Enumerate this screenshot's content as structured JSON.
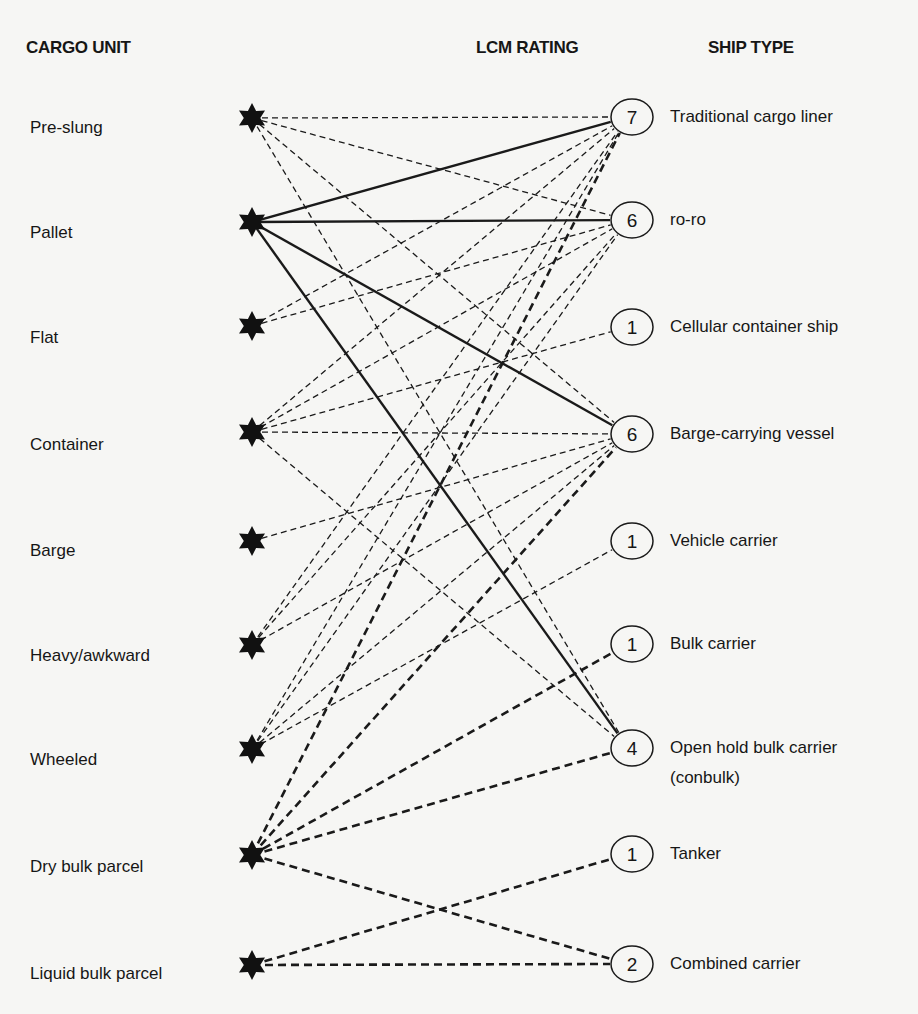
{
  "headers": {
    "cargo_unit": "CARGO UNIT",
    "lcm_rating": "LCM RATING",
    "ship_type": "SHIP TYPE"
  },
  "cargo_units": [
    {
      "label": "Pre-slung",
      "y": 118,
      "label_y": 128
    },
    {
      "label": "Pallet",
      "y": 222,
      "label_y": 233
    },
    {
      "label": "Flat",
      "y": 326,
      "label_y": 338
    },
    {
      "label": "Container",
      "y": 432,
      "label_y": 445
    },
    {
      "label": "Barge",
      "y": 541,
      "label_y": 551
    },
    {
      "label": "Heavy/awkward",
      "y": 645,
      "label_y": 656
    },
    {
      "label": "Wheeled",
      "y": 749,
      "label_y": 760
    },
    {
      "label": "Dry bulk parcel",
      "y": 855,
      "label_y": 867
    },
    {
      "label": "Liquid bulk parcel",
      "y": 965,
      "label_y": 974
    }
  ],
  "ship_types": [
    {
      "label": "Traditional cargo liner",
      "rating": "7",
      "y": 117
    },
    {
      "label": "ro-ro",
      "rating": "6",
      "y": 220
    },
    {
      "label": "Cellular container ship",
      "rating": "1",
      "y": 327
    },
    {
      "label": "Barge-carrying vessel",
      "rating": "6",
      "y": 434
    },
    {
      "label": "Vehicle carrier",
      "rating": "1",
      "y": 541
    },
    {
      "label": "Bulk carrier",
      "rating": "1",
      "y": 644
    },
    {
      "label": "Open hold bulk carrier",
      "label2": "(conbulk)",
      "rating": "4",
      "y": 748
    },
    {
      "label": "Tanker",
      "rating": "1",
      "y": 854
    },
    {
      "label": "Combined carrier",
      "rating": "2",
      "y": 964
    }
  ],
  "legend_styles": {
    "solid": "primary suitability (pallet)",
    "dashed": "general cargo suitability",
    "heavy_dashed": "bulk cargo suitability"
  },
  "edges": [
    {
      "from": 0,
      "to": 0,
      "style": "dashed"
    },
    {
      "from": 0,
      "to": 1,
      "style": "dashed"
    },
    {
      "from": 0,
      "to": 3,
      "style": "dashed"
    },
    {
      "from": 0,
      "to": 6,
      "style": "dashed"
    },
    {
      "from": 1,
      "to": 0,
      "style": "solid"
    },
    {
      "from": 1,
      "to": 1,
      "style": "solid"
    },
    {
      "from": 1,
      "to": 3,
      "style": "solid"
    },
    {
      "from": 1,
      "to": 6,
      "style": "solid"
    },
    {
      "from": 2,
      "to": 0,
      "style": "dashed"
    },
    {
      "from": 2,
      "to": 1,
      "style": "dashed"
    },
    {
      "from": 3,
      "to": 0,
      "style": "dashed"
    },
    {
      "from": 3,
      "to": 1,
      "style": "dashed"
    },
    {
      "from": 3,
      "to": 2,
      "style": "dashed"
    },
    {
      "from": 3,
      "to": 3,
      "style": "dashed"
    },
    {
      "from": 3,
      "to": 6,
      "style": "dashed"
    },
    {
      "from": 4,
      "to": 3,
      "style": "dashed"
    },
    {
      "from": 5,
      "to": 0,
      "style": "dashed"
    },
    {
      "from": 5,
      "to": 1,
      "style": "dashed"
    },
    {
      "from": 5,
      "to": 3,
      "style": "dashed"
    },
    {
      "from": 6,
      "to": 0,
      "style": "dashed"
    },
    {
      "from": 6,
      "to": 1,
      "style": "dashed"
    },
    {
      "from": 6,
      "to": 3,
      "style": "dashed"
    },
    {
      "from": 6,
      "to": 4,
      "style": "dashed"
    },
    {
      "from": 7,
      "to": 0,
      "style": "heavy"
    },
    {
      "from": 7,
      "to": 3,
      "style": "heavy"
    },
    {
      "from": 7,
      "to": 5,
      "style": "heavy"
    },
    {
      "from": 7,
      "to": 6,
      "style": "heavy"
    },
    {
      "from": 7,
      "to": 8,
      "style": "heavy"
    },
    {
      "from": 8,
      "to": 7,
      "style": "heavy"
    },
    {
      "from": 8,
      "to": 8,
      "style": "heavy"
    }
  ],
  "geometry": {
    "star_x": 252,
    "circle_x": 628,
    "circle_r": 18
  }
}
